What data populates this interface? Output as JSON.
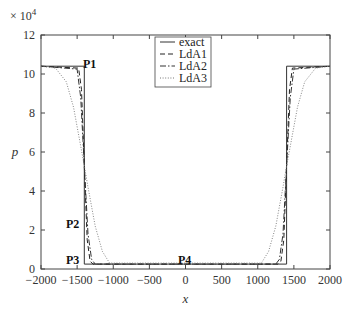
{
  "chart_data": {
    "type": "line",
    "title": "",
    "xlabel": "x",
    "ylabel": "p",
    "y_multiplier": "× 10^4",
    "xlim": [
      -2000,
      2000
    ],
    "ylim": [
      0,
      12
    ],
    "xticks": [
      -2000,
      -1500,
      -1000,
      -500,
      0,
      500,
      1000,
      1500,
      2000
    ],
    "yticks": [
      0,
      2,
      4,
      6,
      8,
      10,
      12
    ],
    "grid": false,
    "legend_position": "top-center",
    "legend": [
      "exact",
      "LdA1",
      "LdA2",
      "LdA3"
    ],
    "annotations": [
      {
        "text": "P1",
        "x": -1380,
        "y": 10.4
      },
      {
        "text": "P2",
        "x": -1500,
        "y": 2.4
      },
      {
        "text": "P3",
        "x": -1500,
        "y": 0.3
      },
      {
        "text": "P4",
        "x": 0,
        "y": 0.3
      }
    ],
    "series": [
      {
        "name": "exact",
        "style": "solid",
        "x": [
          -2000,
          -1400,
          -1400,
          1400,
          1400,
          2000
        ],
        "y": [
          10.4,
          10.4,
          0.25,
          0.25,
          10.4,
          10.4
        ]
      },
      {
        "name": "LdA1",
        "style": "dashed",
        "x": [
          -2000,
          -1480,
          -1440,
          -1400,
          -1360,
          -1320,
          -1280,
          1280,
          1320,
          1360,
          1400,
          1440,
          1480,
          2000
        ],
        "y": [
          10.4,
          10.3,
          9.2,
          5.3,
          1.5,
          0.4,
          0.25,
          0.25,
          0.4,
          1.5,
          5.3,
          9.2,
          10.3,
          10.4
        ]
      },
      {
        "name": "LdA2",
        "style": "dashdot",
        "x": [
          -2000,
          -1500,
          -1450,
          -1400,
          -1350,
          -1300,
          -1250,
          1250,
          1300,
          1350,
          1400,
          1450,
          1500,
          2000
        ],
        "y": [
          10.4,
          10.25,
          8.8,
          5.3,
          1.8,
          0.5,
          0.25,
          0.25,
          0.5,
          1.8,
          5.3,
          8.8,
          10.25,
          10.4
        ]
      },
      {
        "name": "LdA3",
        "style": "dotted",
        "x": [
          -2000,
          -1800,
          -1650,
          -1550,
          -1450,
          -1400,
          -1350,
          -1250,
          -1150,
          -1050,
          1050,
          1150,
          1250,
          1350,
          1400,
          1450,
          1550,
          1650,
          1800,
          2000
        ],
        "y": [
          10.4,
          10.3,
          9.6,
          8.3,
          6.3,
          5.3,
          4.2,
          2.2,
          0.9,
          0.3,
          0.3,
          0.9,
          2.2,
          4.2,
          5.3,
          6.3,
          8.3,
          9.6,
          10.3,
          10.4
        ]
      }
    ]
  }
}
